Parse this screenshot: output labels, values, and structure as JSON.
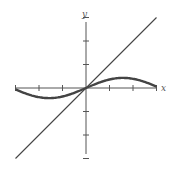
{
  "chart_data": {
    "type": "line",
    "title": "",
    "xlabel": "x",
    "ylabel": "y",
    "xlim": [
      -3,
      3
    ],
    "ylim": [
      -3,
      3
    ],
    "grid": false,
    "x_ticks": [
      -3,
      -2,
      -1,
      0,
      1,
      2,
      3
    ],
    "y_ticks": [
      -3,
      -2,
      -1,
      0,
      1,
      2,
      3
    ],
    "series": [
      {
        "name": "y = sin x",
        "style": "thick",
        "x": [
          -3,
          -2.36,
          -1.57,
          -0.79,
          0,
          0.79,
          1.57,
          2.36,
          3
        ],
        "values": [
          -0.14,
          -0.7,
          -1,
          -0.7,
          0,
          0.7,
          1,
          0.7,
          0.14
        ]
      },
      {
        "name": "y = x",
        "style": "thin",
        "x": [
          -3,
          3
        ],
        "values": [
          -3,
          3
        ]
      }
    ],
    "colors": {
      "axis": "#555555",
      "curve": "#444444"
    }
  },
  "labels": {
    "x_axis": "x",
    "y_axis": "y"
  }
}
